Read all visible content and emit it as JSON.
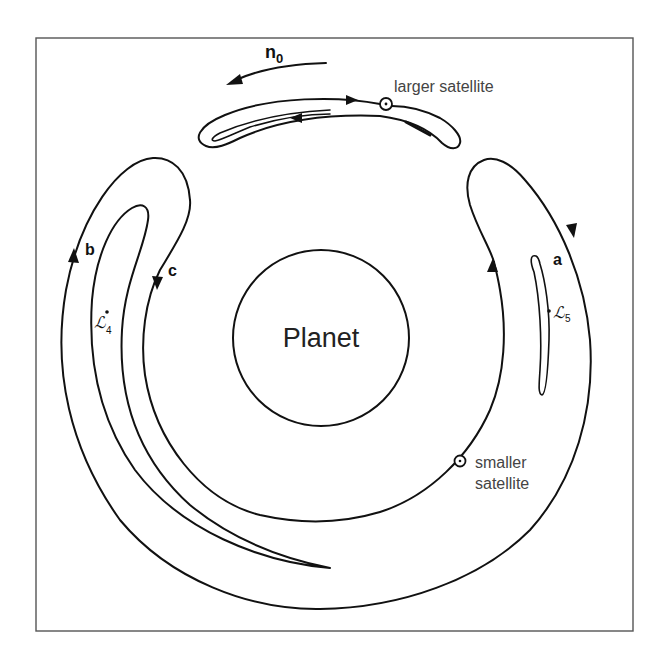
{
  "figure": {
    "planet_label": "Planet",
    "mean_motion_label": "n",
    "mean_motion_subscript": "0",
    "larger_satellite_label": "larger satellite",
    "smaller_satellite_label_line1": "smaller",
    "smaller_satellite_label_line2": "satellite",
    "orbit_labels": {
      "a": "a",
      "b": "b",
      "c": "c"
    },
    "lagrange_points": {
      "L4": {
        "symbol": "ℒ",
        "subscript": "4"
      },
      "L5": {
        "symbol": "ℒ",
        "subscript": "5"
      }
    },
    "colors": {
      "line": "#111111",
      "frame": "#555555",
      "background": "#ffffff",
      "text": "#333333"
    }
  }
}
